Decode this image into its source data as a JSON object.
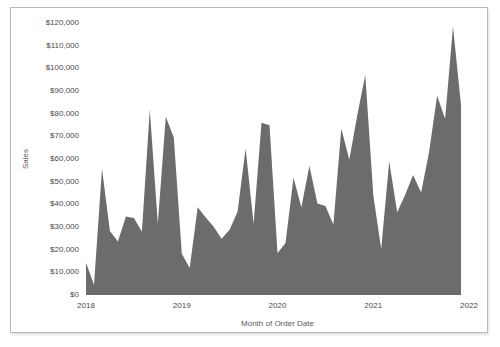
{
  "panel": {
    "border_color": "#b9b9b9",
    "background": "#ffffff"
  },
  "chart_data": {
    "type": "area",
    "title": "",
    "xlabel": "Month of Order Date",
    "ylabel": "Sales",
    "legend": "none",
    "grid": "off",
    "area_color": "#6c6c6c",
    "tick_color": "#4a4a4a",
    "ylim": [
      0,
      120000
    ],
    "y_tick_step": 10000,
    "y_tick_labels": [
      "$0",
      "$10,000",
      "$20,000",
      "$30,000",
      "$40,000",
      "$50,000",
      "$60,000",
      "$70,000",
      "$80,000",
      "$90,000",
      "$100,000",
      "$110,000",
      "$120,000"
    ],
    "x_tick_labels": [
      "2018",
      "2019",
      "2020",
      "2021",
      "2022"
    ],
    "x": [
      "2018-01",
      "2018-02",
      "2018-03",
      "2018-04",
      "2018-05",
      "2018-06",
      "2018-07",
      "2018-08",
      "2018-09",
      "2018-10",
      "2018-11",
      "2018-12",
      "2019-01",
      "2019-02",
      "2019-03",
      "2019-04",
      "2019-05",
      "2019-06",
      "2019-07",
      "2019-08",
      "2019-09",
      "2019-10",
      "2019-11",
      "2019-12",
      "2020-01",
      "2020-02",
      "2020-03",
      "2020-04",
      "2020-05",
      "2020-06",
      "2020-07",
      "2020-08",
      "2020-09",
      "2020-10",
      "2020-11",
      "2020-12",
      "2021-01",
      "2021-02",
      "2021-03",
      "2021-04",
      "2021-05",
      "2021-06",
      "2021-07",
      "2021-08",
      "2021-09",
      "2021-10",
      "2021-11",
      "2021-12"
    ],
    "series": [
      {
        "name": "Sales",
        "values": [
          14237,
          4520,
          55691,
          28295,
          23648,
          34595,
          33946,
          27909,
          81777,
          31453,
          78629,
          69545,
          18174,
          11951,
          38726,
          34195,
          30131,
          24797,
          28765,
          36898,
          64595,
          31404,
          75973,
          74920,
          18542,
          22978,
          51716,
          38750,
          56988,
          40344,
          39262,
          31115,
          73410,
          59687,
          79412,
          96999,
          43971,
          20301,
          58872,
          36522,
          44261,
          52982,
          45264,
          63121,
          87867,
          77777,
          118448,
          83829
        ]
      }
    ]
  }
}
